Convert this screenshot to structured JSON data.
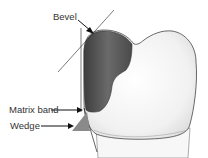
{
  "figure": {
    "labels": {
      "bevel": "Bevel",
      "matrix_band": "Matrix band",
      "wedge": "Wedge"
    },
    "colors": {
      "tooth_fill": "#f2f2f2",
      "tooth_outline": "#555555",
      "restoration": "#5a5a5a",
      "wedge": "#8a8a8a",
      "line": "#222222"
    }
  }
}
